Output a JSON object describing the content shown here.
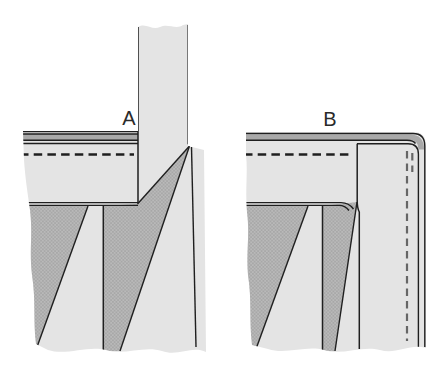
{
  "diagram": {
    "kind": "sewing-technique-illustration",
    "panels": [
      {
        "label": "A"
      },
      {
        "label": "B"
      }
    ],
    "colors": {
      "background": "#ffffff",
      "fabric_light": "#e4e4e4",
      "fabric_shade": "#b9b9b9",
      "fabric_shade_dot": "#a0a0a0",
      "band_stripe": "#a9a9a9",
      "outline": "#1f1f1f",
      "stitch_dash": "#1f1f1f",
      "stitch_dash_light": "#666666",
      "label_color": "#2a2a2a"
    }
  }
}
